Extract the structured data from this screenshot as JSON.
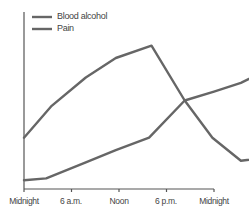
{
  "chart_data": {
    "type": "line",
    "title": "",
    "xlabel": "",
    "ylabel": "",
    "categories": [
      "Midnight",
      "6 a.m.",
      "Noon",
      "6 p.m.",
      "Midnight"
    ],
    "x_hours": [
      0,
      24
    ],
    "ylim": [
      0,
      100
    ],
    "grid": false,
    "legend_position": "top-left",
    "series": [
      {
        "name": "Blood alcohol",
        "color": "#666666",
        "x": [
          0,
          3.5,
          7.8,
          11.6,
          16.1,
          20.3,
          23.8,
          27.4,
          31.6,
          35.3,
          39.1,
          43.1,
          48
        ],
        "values": [
          29,
          47,
          63,
          74,
          81,
          50,
          29,
          16,
          18,
          16,
          12,
          11,
          29
        ]
      },
      {
        "name": "Pain",
        "color": "#666666",
        "x": [
          0,
          2.8,
          7.8,
          11.6,
          15.8,
          20.3,
          24,
          27.4,
          35.8,
          39.3,
          48
        ],
        "values": [
          5,
          6,
          15,
          22,
          29,
          50,
          55,
          60,
          78,
          26,
          3
        ]
      }
    ]
  },
  "legend": {
    "items": [
      {
        "label": "Blood alcohol"
      },
      {
        "label": "Pain"
      }
    ]
  },
  "x_axis": {
    "ticks": [
      "Midnight",
      "6 a.m.",
      "Noon",
      "6 p.m.",
      "Midnight"
    ]
  }
}
